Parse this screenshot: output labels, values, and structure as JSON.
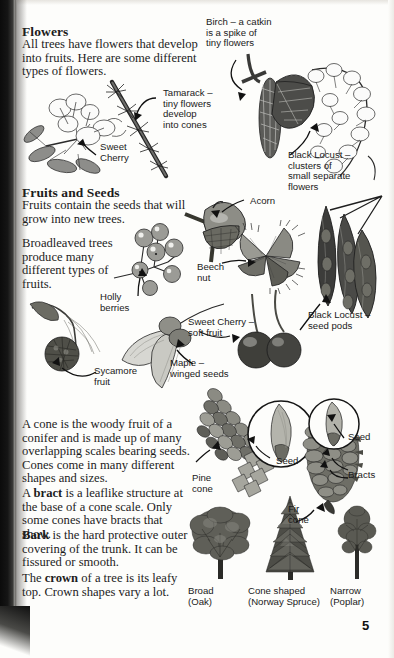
{
  "page": {
    "number": "5",
    "background": "#fdfdfb",
    "ink": "#1c1c1c"
  },
  "sections": [
    {
      "id": "flowers",
      "heading": "Flowers",
      "paragraphs": [
        "All trees have flowers that develop into fruits. Here are some different types of flowers."
      ]
    },
    {
      "id": "fruits-and-seeds",
      "heading": "Fruits and Seeds",
      "paragraphs": [
        "Fruits contain the seeds that will grow into new trees.",
        "Broadleaved trees produce many different types of fruits."
      ]
    },
    {
      "id": "cones",
      "heading": "",
      "paragraphs": [
        "A cone is the woody fruit of a conifer and is made up of many overlapping scales bearing seeds. Cones come in many different shapes and sizes."
      ]
    }
  ],
  "rich_paragraphs": {
    "bract": {
      "lead": "A ",
      "bold": "bract",
      "rest": " is a leaflike structure at the base of a cone scale. Only some cones have bracts that show."
    },
    "bark": {
      "lead": "",
      "bold": "Bark",
      "rest": " is the hard protective outer covering of the trunk. It can be fissured or smooth."
    },
    "crown": {
      "lead": "The ",
      "bold": "crown",
      "rest": " of a tree is its leafy top. Crown shapes vary a lot."
    }
  },
  "callouts": {
    "birch": "Birch – a catkin\nis a spike of\ntiny flowers",
    "tamarack": "Tamarack –\ntiny flowers\ndevelop\ninto cones",
    "sweet_cherry": "Sweet\nCherry",
    "black_locust_flowers": "Black Locust –\nclusters of\nsmall separate\nflowers",
    "acorn": "Acorn",
    "beech_nut": "Beech\nnut",
    "holly_berries": "Holly\nberries",
    "sweet_cherry_fruit": "Sweet Cherry –\nsoft fruit",
    "black_locust_pods": "Black Locust –\nseed pods",
    "sycamore_fruit": "Sycamore\nfruit",
    "maple": "Maple –\nwinged seeds",
    "pine_cone": "Pine\ncone",
    "fir_cone": "Fir\ncone",
    "seed_pine": "Seed",
    "seed_fir": "Seed",
    "bracts": "Bracts"
  },
  "crown_shapes": [
    {
      "name": "Broad",
      "species": "(Oak)"
    },
    {
      "name": "Cone shaped",
      "species": "(Norway Spruce)"
    },
    {
      "name": "Narrow",
      "species": "(Poplar)"
    }
  ],
  "illustrations": [
    {
      "name": "sweet-cherry-blossom-illustration"
    },
    {
      "name": "tamarack-branch-illustration"
    },
    {
      "name": "birch-catkin-illustration"
    },
    {
      "name": "black-locust-flower-cluster-illustration"
    },
    {
      "name": "holly-berries-illustration"
    },
    {
      "name": "acorn-illustration"
    },
    {
      "name": "beech-nut-illustration"
    },
    {
      "name": "black-locust-seed-pods-illustration"
    },
    {
      "name": "maple-winged-seed-illustration"
    },
    {
      "name": "sycamore-fruit-illustration"
    },
    {
      "name": "sweet-cherry-fruit-illustration"
    },
    {
      "name": "pine-cone-illustration"
    },
    {
      "name": "pine-seed-magnifier-illustration"
    },
    {
      "name": "fir-cone-illustration"
    },
    {
      "name": "fir-seed-magnifier-illustration"
    },
    {
      "name": "broad-oak-crown-illustration"
    },
    {
      "name": "cone-shaped-spruce-crown-illustration"
    },
    {
      "name": "narrow-poplar-crown-illustration"
    }
  ]
}
